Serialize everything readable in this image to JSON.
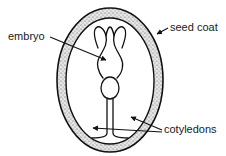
{
  "diagram": {
    "labels": {
      "embryo": "embryo",
      "seed_coat": "seed coat",
      "cotyledons": "cotyledons"
    },
    "colors": {
      "stroke": "#111111",
      "seed_coat_fill": "#d9d9d9",
      "background": "#ffffff"
    }
  }
}
